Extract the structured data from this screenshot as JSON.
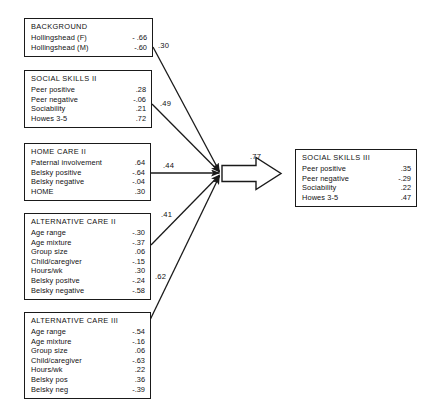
{
  "diagram": {
    "type": "path-analysis-diagram",
    "nodes": [
      {
        "id": "background",
        "title": "BACKGROUND",
        "rows": [
          {
            "label": "Hollingshead (F)",
            "value": "- .66"
          },
          {
            "label": "Hollingshead (M)",
            "value": "-.60"
          }
        ]
      },
      {
        "id": "social_skills_ii",
        "title": "SOCIAL SKILLS  II",
        "rows": [
          {
            "label": "Peer positive",
            "value": ".28"
          },
          {
            "label": "Peer negative",
            "value": "-.06"
          },
          {
            "label": "Sociability",
            "value": ".21"
          },
          {
            "label": "Howes 3-5",
            "value": ".72"
          }
        ]
      },
      {
        "id": "home_care_ii",
        "title": "HOME CARE   II",
        "rows": [
          {
            "label": "Paternal involvement",
            "value": ".64"
          },
          {
            "label": "Belsky positive",
            "value": "-.64"
          },
          {
            "label": "Belsky negative",
            "value": "-.04"
          },
          {
            "label": "HOME",
            "value": ".30"
          }
        ]
      },
      {
        "id": "alternative_care_ii",
        "title": "ALTERNATIVE CARE  II",
        "rows": [
          {
            "label": "Age range",
            "value": "-.30"
          },
          {
            "label": "Age mixture",
            "value": "-.37"
          },
          {
            "label": "Group size",
            "value": ".06"
          },
          {
            "label": "Child/caregiver",
            "value": "-.15"
          },
          {
            "label": "Hours/wk",
            "value": ".30"
          },
          {
            "label": "Belsky positve",
            "value": "-.24"
          },
          {
            "label": "Belsky negative",
            "value": "-.58"
          }
        ]
      },
      {
        "id": "alternative_care_iii",
        "title": "ALTERNATIVE CARE  III",
        "rows": [
          {
            "label": "Age range",
            "value": "-.54"
          },
          {
            "label": "Age mixture",
            "value": "-.16"
          },
          {
            "label": "Group size",
            "value": ".06"
          },
          {
            "label": "Child/caregiver",
            "value": "-.63"
          },
          {
            "label": "Hours/wk",
            "value": ".22"
          },
          {
            "label": "Belsky pos",
            "value": ".36"
          },
          {
            "label": "Belsky neg",
            "value": "-.39"
          }
        ]
      },
      {
        "id": "social_skills_iii",
        "title": "SOCIAL SKILLS III",
        "rows": [
          {
            "label": "Peer positive",
            "value": ".35"
          },
          {
            "label": "Peer negative",
            "value": "-.29"
          },
          {
            "label": "Sociability",
            "value": ".22"
          },
          {
            "label": "Howes 3-5",
            "value": ".47"
          }
        ]
      }
    ],
    "edges": [
      {
        "id": "e-background",
        "label": ".30",
        "from": "background",
        "to": "junction"
      },
      {
        "id": "e-social-skills-ii",
        "label": ".49",
        "from": "social_skills_ii",
        "to": "junction"
      },
      {
        "id": "e-home-care-ii",
        "label": ".44",
        "from": "home_care_ii",
        "to": "junction"
      },
      {
        "id": "e-alternative-care-ii",
        "label": ".41",
        "from": "alternative_care_ii",
        "to": "junction"
      },
      {
        "id": "e-alternative-care-iii",
        "label": ".62",
        "from": "alternative_care_iii",
        "to": "junction"
      },
      {
        "id": "e-outcome",
        "label": ".77",
        "from": "junction",
        "to": "social_skills_iii"
      }
    ],
    "colors": {
      "stroke": "#1a1a1a",
      "background": "#ffffff"
    }
  }
}
